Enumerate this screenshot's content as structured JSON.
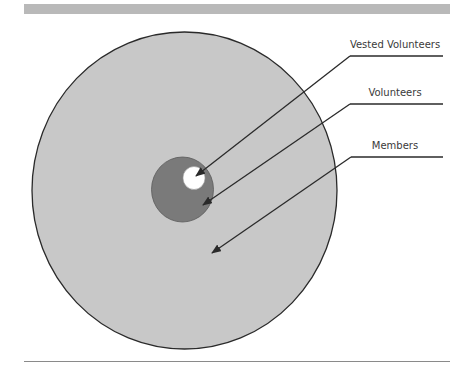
{
  "diagram": {
    "type": "nested-circles",
    "colors": {
      "outer_fill": "#c8c8c8",
      "middle_fill": "#7a7a7a",
      "inner_fill": "#ffffff",
      "stroke": "#2a2a2a",
      "band": "#b9b9b9",
      "rule": "#8a8a8a",
      "text": "#3a3a3a"
    },
    "circles": [
      {
        "name": "Members",
        "cx": 184.5,
        "cy": 190.5,
        "rx": 152.5,
        "ry": 158.5
      },
      {
        "name": "Volunteers",
        "cx": 182.5,
        "cy": 189.5,
        "rx": 31,
        "ry": 32.5
      },
      {
        "name": "Vested Volunteers",
        "cx": 194,
        "cy": 178,
        "rx": 11,
        "ry": 11.5
      }
    ],
    "labels": [
      {
        "text": "Vested Volunteers",
        "x": 395,
        "y": 48
      },
      {
        "text": "Volunteers",
        "x": 395,
        "y": 96
      },
      {
        "text": "Members",
        "x": 395,
        "y": 149
      }
    ]
  }
}
